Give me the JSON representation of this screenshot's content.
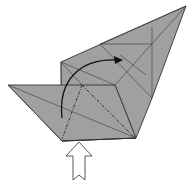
{
  "diagram": {
    "type": "origami-step",
    "colors": {
      "paper": "#a0a0a0",
      "lines": "#333333",
      "background": "#ffffff",
      "push_arrow_fill": "#ffffff"
    },
    "symbols": [
      {
        "name": "valley-fold-line",
        "style": "dash-dot"
      },
      {
        "name": "curved-fold-arrow",
        "direction": "up and to the right"
      },
      {
        "name": "push-arrow",
        "direction": "up",
        "style": "hollow"
      }
    ]
  }
}
